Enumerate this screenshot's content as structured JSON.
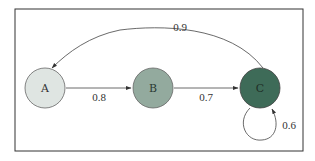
{
  "diagram": {
    "type": "state-transition-graph",
    "frame": {
      "x": 15,
      "y": 9,
      "width": 288,
      "height": 142,
      "stroke": "#333333"
    },
    "nodes": [
      {
        "id": "A",
        "label": "A",
        "cx": 45,
        "cy": 88,
        "r": 20,
        "fill": "#dfe5e2",
        "text_color": "#333333"
      },
      {
        "id": "B",
        "label": "B",
        "cx": 153,
        "cy": 88,
        "r": 20,
        "fill": "#93aa9e",
        "text_color": "#2b3a33"
      },
      {
        "id": "C",
        "label": "C",
        "cx": 260,
        "cy": 88,
        "r": 20,
        "fill": "#3e6b58",
        "text_color": "#1e2f27"
      }
    ],
    "edges": [
      {
        "from": "A",
        "to": "B",
        "label": "0.8",
        "shape": "straight"
      },
      {
        "from": "B",
        "to": "C",
        "label": "0.7",
        "shape": "straight"
      },
      {
        "from": "C",
        "to": "A",
        "label": "0.9",
        "shape": "curved-top"
      },
      {
        "from": "C",
        "to": "C",
        "label": "0.6",
        "shape": "self-loop-bottom"
      }
    ]
  }
}
